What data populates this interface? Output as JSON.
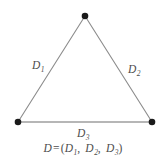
{
  "figure": {
    "background_color": "#ffffff",
    "width": 166,
    "height": 166
  },
  "geometry": {
    "vertices": [
      {
        "name": "apex",
        "x": 85,
        "y": 16
      },
      {
        "name": "bottom-left",
        "x": 18,
        "y": 122
      },
      {
        "name": "bottom-right",
        "x": 152,
        "y": 122
      }
    ],
    "vertex_marker": {
      "shape": "filled-circle",
      "radius": 3.2,
      "color": "#1a1a1a"
    },
    "edges": [
      {
        "name": "left-edge",
        "from": "bottom-left",
        "to": "apex",
        "label": "D1",
        "color": "#8c8c8c",
        "width": 1.1
      },
      {
        "name": "right-edge",
        "from": "apex",
        "to": "bottom-right",
        "label": "D2",
        "color": "#8c8c8c",
        "width": 1.1
      },
      {
        "name": "bottom-edge",
        "from": "bottom-left",
        "to": "bottom-right",
        "label": "D3",
        "color": "#9e9e9e",
        "width": 1.6
      }
    ]
  },
  "labels": {
    "d1": {
      "base": "D",
      "sub": "1"
    },
    "d2": {
      "base": "D",
      "sub": "2"
    },
    "d3": {
      "base": "D",
      "sub": "3"
    }
  },
  "formula": {
    "lhs": "D",
    "equals": "=",
    "open_paren": "(",
    "terms": [
      {
        "base": "D",
        "sub": "1"
      },
      {
        "base": "D",
        "sub": "2"
      },
      {
        "base": "D",
        "sub": "3"
      }
    ],
    "separator": ",",
    "close_paren": ")",
    "plain_text": "D = (D1, D2, D3)"
  },
  "colors": {
    "line": "#8c8c8c",
    "bottom_line": "#9e9e9e",
    "vertex": "#1a1a1a",
    "text": "#4d4d4d",
    "background": "#ffffff"
  }
}
